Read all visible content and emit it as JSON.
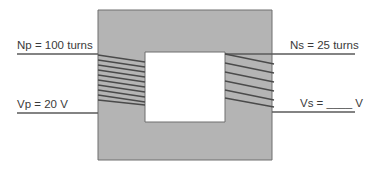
{
  "diagram": {
    "primary": {
      "turns_label": "Np = 100 turns",
      "voltage_label": "Vp = 20 V",
      "coil_count_drawn": 10
    },
    "secondary": {
      "turns_label": "Ns = 25 turns",
      "voltage_label": "Vs = ____ V",
      "coil_count_drawn": 6
    },
    "colors": {
      "core_fill": "#b4b4b4",
      "core_stroke": "#6e6e6e",
      "wire": "#5a5a5a",
      "text": "#3a3a3a",
      "background": "#ffffff"
    }
  }
}
